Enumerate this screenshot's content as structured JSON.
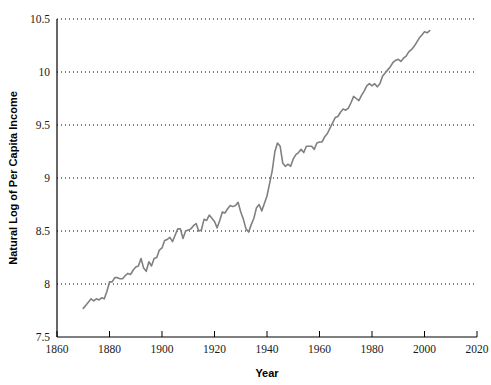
{
  "chart_data": {
    "type": "line",
    "title": "",
    "xlabel": "Year",
    "ylabel": "Natural Log of Per Capita Income",
    "xlim": [
      1860,
      2020
    ],
    "ylim": [
      7.5,
      10.5
    ],
    "xticks": [
      1860,
      1880,
      1900,
      1920,
      1940,
      1960,
      1980,
      2000,
      2020
    ],
    "yticks": [
      7.5,
      8,
      8.5,
      9,
      9.5,
      10,
      10.5
    ],
    "xtick_labels": [
      "1860",
      "1880",
      "1900",
      "1920",
      "1940",
      "1960",
      "1980",
      "2000",
      "2020"
    ],
    "ytick_labels": [
      "7.5",
      "8",
      "8.5",
      "9",
      "9.5",
      "10",
      "10.5"
    ],
    "grid": "horizontal-dotted",
    "legend": "none",
    "line_color": "#808080",
    "series": [
      {
        "name": "Natural Log of Per Capita Income",
        "x": [
          1870,
          1871,
          1872,
          1873,
          1874,
          1875,
          1876,
          1877,
          1878,
          1879,
          1880,
          1881,
          1882,
          1883,
          1884,
          1885,
          1886,
          1887,
          1888,
          1889,
          1890,
          1891,
          1892,
          1893,
          1894,
          1895,
          1896,
          1897,
          1898,
          1899,
          1900,
          1901,
          1902,
          1903,
          1904,
          1905,
          1906,
          1907,
          1908,
          1909,
          1910,
          1911,
          1912,
          1913,
          1914,
          1915,
          1916,
          1917,
          1918,
          1919,
          1920,
          1921,
          1922,
          1923,
          1924,
          1925,
          1926,
          1927,
          1928,
          1929,
          1930,
          1931,
          1932,
          1933,
          1934,
          1935,
          1936,
          1937,
          1938,
          1939,
          1940,
          1941,
          1942,
          1943,
          1944,
          1945,
          1946,
          1947,
          1948,
          1949,
          1950,
          1951,
          1952,
          1953,
          1954,
          1955,
          1956,
          1957,
          1958,
          1959,
          1960,
          1961,
          1962,
          1963,
          1964,
          1965,
          1966,
          1967,
          1968,
          1969,
          1970,
          1971,
          1972,
          1973,
          1974,
          1975,
          1976,
          1977,
          1978,
          1979,
          1980,
          1981,
          1982,
          1983,
          1984,
          1985,
          1986,
          1987,
          1988,
          1989,
          1990,
          1991,
          1992,
          1993,
          1994,
          1995,
          1996,
          1997,
          1998,
          1999,
          2000,
          2001,
          2002
        ],
        "values": [
          7.77,
          7.8,
          7.83,
          7.86,
          7.84,
          7.86,
          7.85,
          7.87,
          7.86,
          7.93,
          8.02,
          8.02,
          8.06,
          8.06,
          8.05,
          8.05,
          8.08,
          8.1,
          8.09,
          8.13,
          8.16,
          8.17,
          8.24,
          8.15,
          8.12,
          8.21,
          8.17,
          8.24,
          8.25,
          8.32,
          8.34,
          8.41,
          8.42,
          8.44,
          8.4,
          8.46,
          8.52,
          8.52,
          8.43,
          8.5,
          8.51,
          8.52,
          8.55,
          8.57,
          8.5,
          8.51,
          8.61,
          8.6,
          8.65,
          8.62,
          8.59,
          8.53,
          8.6,
          8.68,
          8.67,
          8.71,
          8.74,
          8.73,
          8.74,
          8.77,
          8.68,
          8.61,
          8.52,
          8.49,
          8.56,
          8.62,
          8.72,
          8.75,
          8.69,
          8.76,
          8.83,
          8.95,
          9.07,
          9.25,
          9.33,
          9.3,
          9.14,
          9.11,
          9.13,
          9.11,
          9.18,
          9.22,
          9.24,
          9.27,
          9.24,
          9.3,
          9.3,
          9.3,
          9.27,
          9.33,
          9.34,
          9.34,
          9.39,
          9.42,
          9.47,
          9.52,
          9.57,
          9.58,
          9.62,
          9.65,
          9.64,
          9.66,
          9.71,
          9.77,
          9.75,
          9.73,
          9.78,
          9.82,
          9.87,
          9.89,
          9.87,
          9.89,
          9.86,
          9.89,
          9.96,
          9.99,
          10.02,
          10.05,
          10.09,
          10.11,
          10.12,
          10.1,
          10.13,
          10.15,
          10.19,
          10.21,
          10.24,
          10.28,
          10.32,
          10.35,
          10.38,
          10.37,
          10.39
        ]
      }
    ]
  },
  "axes": {
    "ylabel_text": "Natural Log of Per Capita Income",
    "xlabel_text": "Year"
  }
}
